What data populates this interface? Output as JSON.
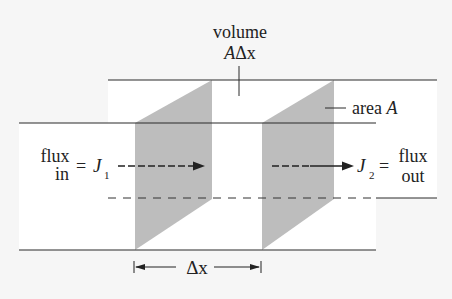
{
  "diagram": {
    "title_line1": "volume",
    "title_line2_var": "A",
    "title_line2_delta": "Δx",
    "area_label": "area",
    "area_var": "A",
    "flux_in_top": "flux",
    "flux_in_bottom": "in",
    "equals": "=",
    "j1_symbol": "J",
    "j1_sub": "1",
    "j2_symbol": "J",
    "j2_sub": "2",
    "flux_out_top": "flux",
    "flux_out_bottom": "out",
    "delta_x_label": "Δx",
    "colors": {
      "background": "#f6f6f6",
      "line": "#2a2a2a",
      "panel_fill": "#bdbdbd",
      "channel": "#ffffff"
    }
  }
}
